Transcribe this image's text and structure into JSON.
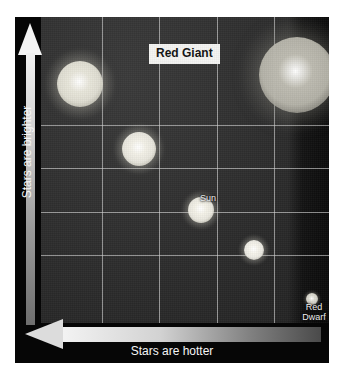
{
  "chart_data": {
    "type": "scatter",
    "xlabel": "Stars are hotter",
    "ylabel": "Stars are brighter",
    "x_axis_direction": "right-to-left",
    "y_axis_direction": "bottom-to-top",
    "grid": true,
    "grid_columns": 5,
    "grid_rows": 5,
    "background_color": "#2b2b2b",
    "frame_color": "#060606",
    "gridline_color": "#d7d7d7",
    "axis_text_color": "#f5f5f5",
    "points": [
      {
        "name": "bright-cool-giant",
        "label": "",
        "x_pct": 13.5,
        "y_pct": 22.0,
        "radius_px": 23,
        "color": "#e8e6da",
        "glow": "#cfcdbf"
      },
      {
        "name": "upper-mid-star",
        "label": "",
        "x_pct": 34.0,
        "y_pct": 43.0,
        "radius_px": 17,
        "color": "#f2f0e6",
        "glow": "#d8d6c9"
      },
      {
        "name": "sun",
        "label": "Sun",
        "x_pct": 55.5,
        "y_pct": 63.0,
        "radius_px": 13,
        "color": "#f4f2e8",
        "glow": "#d6d4c6"
      },
      {
        "name": "lower-small-star",
        "label": "",
        "x_pct": 74.0,
        "y_pct": 76.0,
        "radius_px": 10,
        "color": "#f6f4ec",
        "glow": "#d2d0c4"
      },
      {
        "name": "red-dwarf",
        "label": "Red\nDwarf",
        "x_pct": 94.0,
        "y_pct": 92.0,
        "radius_px": 6,
        "color": "#dedcd2",
        "glow": "#a9a79c"
      },
      {
        "name": "red-giant",
        "label": "Red Giant",
        "x_pct": 89.0,
        "y_pct": 19.0,
        "radius_px": 38,
        "color": "#bdbbb0",
        "glow": "#8d8b82"
      }
    ]
  },
  "labels": {
    "red_giant": "Red Giant",
    "sun": "Sun",
    "red_dwarf_line1": "Red",
    "red_dwarf_line2": "Dwarf",
    "y_axis": "Stars are brighter",
    "x_axis": "Stars are hotter"
  },
  "icons": {
    "y_arrow": "arrow-up-icon",
    "x_arrow": "arrow-left-icon"
  }
}
